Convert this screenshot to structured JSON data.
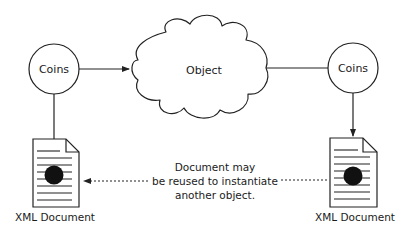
{
  "diagram": {
    "nodes": {
      "coins_left": {
        "label": "Coins",
        "shape": "circle"
      },
      "object": {
        "label": "Object",
        "shape": "cloud"
      },
      "coins_right": {
        "label": "Coins",
        "shape": "circle"
      },
      "doc_left": {
        "label": "XML Document",
        "shape": "document-icon"
      },
      "doc_right": {
        "label": "XML Document",
        "shape": "document-icon"
      }
    },
    "edges": [
      {
        "from": "coins_left",
        "to": "object",
        "style": "solid",
        "arrow": "to"
      },
      {
        "from": "object",
        "to": "coins_right",
        "style": "solid",
        "arrow": "none"
      },
      {
        "from": "coins_left",
        "to": "doc_left",
        "style": "solid",
        "arrow": "none"
      },
      {
        "from": "coins_right",
        "to": "doc_right",
        "style": "solid",
        "arrow": "to"
      },
      {
        "from": "doc_right",
        "to": "doc_left",
        "style": "dotted",
        "arrow": "to"
      }
    ],
    "annotation": {
      "line1": "Document may",
      "line2": "be reused to instantiate",
      "line3": "another object."
    },
    "colors": {
      "stroke": "#222222",
      "fill": "#ffffff",
      "text": "#1a1a1a"
    }
  }
}
